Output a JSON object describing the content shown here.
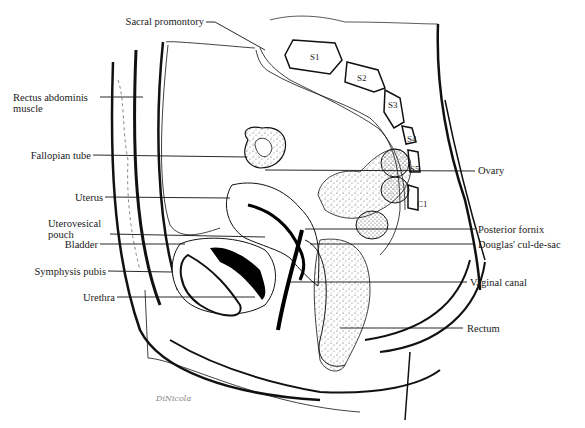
{
  "diagram": {
    "signature": "DiNicola",
    "vertebrae": [
      "S1",
      "S2",
      "S3",
      "S4",
      "S5",
      "C1"
    ],
    "labels_left": [
      {
        "id": "sacral-promontory",
        "text": "Sacral promontory"
      },
      {
        "id": "rectus-abdominis",
        "text": "Rectus abdominis",
        "text2": "muscle"
      },
      {
        "id": "fallopian-tube",
        "text": "Fallopian tube"
      },
      {
        "id": "uterus",
        "text": "Uterus"
      },
      {
        "id": "uterovesical-pouch",
        "text": "Uterovesical",
        "text2": "pouch"
      },
      {
        "id": "bladder",
        "text": "Bladder"
      },
      {
        "id": "symphysis-pubis",
        "text": "Symphysis pubis"
      },
      {
        "id": "urethra",
        "text": "Urethra"
      }
    ],
    "labels_right": [
      {
        "id": "ovary",
        "text": "Ovary"
      },
      {
        "id": "posterior-fornix",
        "text": "Posterior fornix"
      },
      {
        "id": "douglas-cul-de-sac",
        "text": "Douglas' cul-de-sac"
      },
      {
        "id": "vaginal-canal",
        "text": "Vaginal canal"
      },
      {
        "id": "rectum",
        "text": "Rectum"
      }
    ],
    "colors": {
      "ink": "#111111",
      "stipple": "#555555",
      "background": "#ffffff"
    }
  }
}
